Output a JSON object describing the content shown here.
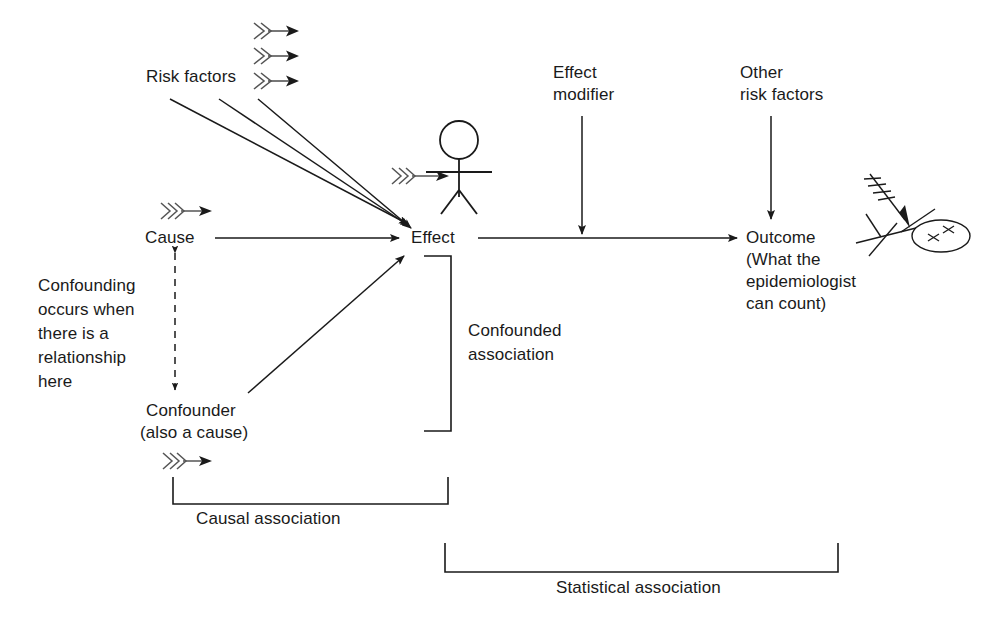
{
  "diagram": {
    "background_color": "#ffffff",
    "stroke_color": "#1a1a1a",
    "text_color": "#1a1a1a"
  },
  "nodes": {
    "risk_factors": "Risk factors",
    "cause": "Cause",
    "effect": "Effect",
    "effect_modifier_line1": "Effect",
    "effect_modifier_line2": "modifier",
    "other_risk_factors_line1": "Other",
    "other_risk_factors_line2": "risk factors",
    "outcome_line1": "Outcome",
    "outcome_line2": "(What the",
    "outcome_line3": "epidemiologist",
    "outcome_line4": "can count)",
    "confounder_line1": "Confounder",
    "confounder_line2": "(also a cause)"
  },
  "annotations": {
    "confounding_note_line1": "Confounding",
    "confounding_note_line2": "occurs when",
    "confounding_note_line3": "there is a",
    "confounding_note_line4": "relationship",
    "confounding_note_line5": "here",
    "confounded_association_line1": "Confounded",
    "confounded_association_line2": "association",
    "causal_association": "Causal association",
    "statistical_association": "Statistical association"
  },
  "icons": {
    "dart_arrow_risk_1": "feathered-arrow-icon",
    "dart_arrow_risk_2": "feathered-arrow-icon",
    "dart_arrow_risk_3": "feathered-arrow-icon",
    "dart_arrow_cause": "feathered-arrow-icon",
    "dart_arrow_confounder": "feathered-arrow-icon",
    "dart_arrow_person": "feathered-arrow-icon",
    "dart_arrow_outcome": "feathered-arrow-icon",
    "standing_person": "stick-figure-standing-icon",
    "fallen_person": "stick-figure-fallen-dead-icon"
  },
  "brackets": {
    "confounded": "vertical-bracket",
    "causal": "horizontal-bracket",
    "statistical": "horizontal-bracket"
  }
}
